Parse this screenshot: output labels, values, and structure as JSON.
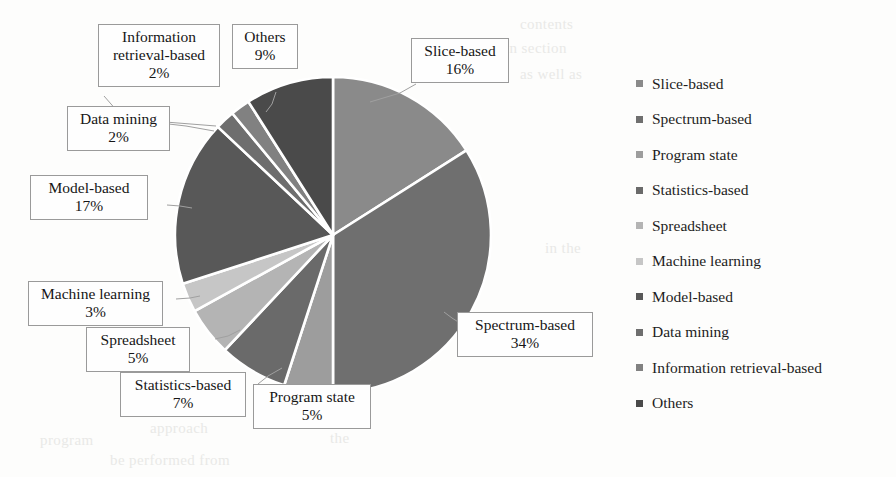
{
  "chart_data": {
    "type": "pie",
    "title": "",
    "categories": [
      "Slice-based",
      "Spectrum-based",
      "Program state",
      "Statistics-based",
      "Spreadsheet",
      "Machine learning",
      "Model-based",
      "Data mining",
      "Information retrieval-based",
      "Others"
    ],
    "values": [
      16,
      34,
      5,
      7,
      5,
      3,
      17,
      2,
      2,
      9
    ],
    "value_labels": [
      "16%",
      "34%",
      "5%",
      "7%",
      "5%",
      "3%",
      "17%",
      "2%",
      "2%",
      "9%"
    ],
    "units": "percent",
    "total": 100,
    "start_angle_deg": 0,
    "direction": "clockwise",
    "legend_position": "right",
    "grid": false,
    "colors": [
      "#8a8a8a",
      "#6f6f6f",
      "#9d9d9d",
      "#6a6a6a",
      "#b4b4b4",
      "#c6c6c6",
      "#585858",
      "#6e6e6e",
      "#818181",
      "#4a4a4a"
    ]
  },
  "legend": {
    "items": [
      {
        "label": "Slice-based",
        "color": "#8a8a8a"
      },
      {
        "label": "Spectrum-based",
        "color": "#6f6f6f"
      },
      {
        "label": "Program state",
        "color": "#9d9d9d"
      },
      {
        "label": "Statistics-based",
        "color": "#6a6a6a"
      },
      {
        "label": "Spreadsheet",
        "color": "#b4b4b4"
      },
      {
        "label": "Machine learning",
        "color": "#c6c6c6"
      },
      {
        "label": "Model-based",
        "color": "#585858"
      },
      {
        "label": "Data mining",
        "color": "#6e6e6e"
      },
      {
        "label": "Information retrieval-based",
        "color": "#818181"
      },
      {
        "label": "Others",
        "color": "#4a4a4a"
      }
    ]
  },
  "callouts": {
    "slice_based": {
      "name": "Slice-based",
      "pct": "16%"
    },
    "spectrum_based": {
      "name": "Spectrum-based",
      "pct": "34%"
    },
    "program_state": {
      "name": "Program state",
      "pct": "5%"
    },
    "statistics": {
      "name": "Statistics-based",
      "pct": "7%"
    },
    "spreadsheet": {
      "name": "Spreadsheet",
      "pct": "5%"
    },
    "machine_learning": {
      "name": "Machine learning",
      "pct": "3%"
    },
    "model_based": {
      "name": "Model-based",
      "pct": "17%"
    },
    "data_mining": {
      "name": "Data mining",
      "pct": "2%"
    },
    "info_retrieval": {
      "name": "Information retrieval-based",
      "pct": "2%"
    },
    "others": {
      "name": "Others",
      "pct": "9%"
    }
  },
  "info_retrieval_lines": {
    "line1": "Information",
    "line2": "retrieval-based"
  },
  "bleed_text": {
    "t1": "contents",
    "t2": "in section",
    "t3": "as well as",
    "t4": "in the",
    "t5": "approach",
    "t6": "the",
    "t7": "be performed from",
    "t8": "program"
  }
}
